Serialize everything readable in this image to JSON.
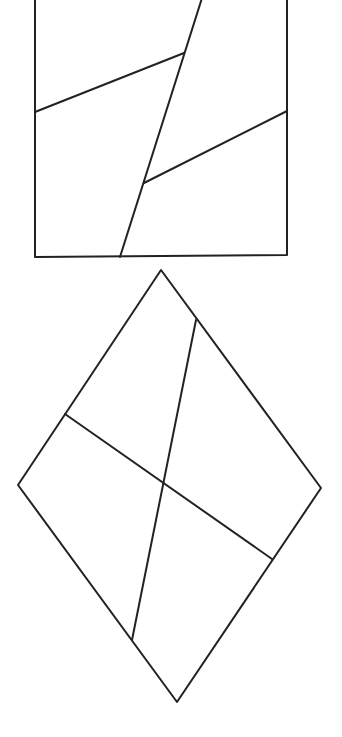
{
  "diagram": {
    "width": 342,
    "height": 737,
    "background": "#ffffff",
    "stroke_color": "#222222",
    "stroke_width": 2,
    "figures": [
      {
        "name": "square-figure",
        "outline": [
          [
            35,
            -2
          ],
          [
            287,
            -2
          ],
          [
            287,
            255
          ],
          [
            35,
            257
          ]
        ],
        "lines": [
          {
            "name": "square-diagonal-cut",
            "from": [
              202,
              -2
            ],
            "to": [
              120,
              257
            ]
          },
          {
            "name": "square-upper-left-cut",
            "from": [
              35,
              112
            ],
            "to": [
              184,
              53
            ]
          },
          {
            "name": "square-lower-right-cut",
            "from": [
              144,
              183
            ],
            "to": [
              287,
              111
            ]
          }
        ]
      },
      {
        "name": "diamond-figure",
        "outline": [
          [
            161,
            270
          ],
          [
            321,
            488
          ],
          [
            177,
            702
          ],
          [
            18,
            485
          ]
        ],
        "lines": [
          {
            "name": "diamond-long-cut",
            "from": [
              196,
              320
            ],
            "to": [
              132,
              640
            ]
          },
          {
            "name": "diamond-cross-cut",
            "from": [
              65,
              414
            ],
            "to": [
              272,
              559
            ]
          }
        ]
      }
    ]
  }
}
